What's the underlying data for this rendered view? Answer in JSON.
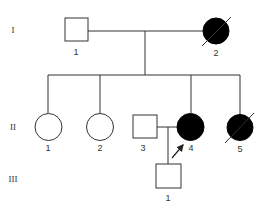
{
  "colors": {
    "line": "#333333",
    "affected": "#000000",
    "unaffected": "#ffffff"
  },
  "generations": [
    {
      "label": "I",
      "y": 30
    },
    {
      "label": "II",
      "y": 127
    },
    {
      "label": "III",
      "y": 179
    }
  ],
  "individuals": [
    {
      "id": "I-1",
      "generation": "I",
      "number": "1",
      "sex": "male",
      "affected": false,
      "deceased": false
    },
    {
      "id": "I-2",
      "generation": "I",
      "number": "2",
      "sex": "female",
      "affected": true,
      "deceased": true
    },
    {
      "id": "II-1",
      "generation": "II",
      "number": "1",
      "sex": "female",
      "affected": false,
      "deceased": false
    },
    {
      "id": "II-2",
      "generation": "II",
      "number": "2",
      "sex": "female",
      "affected": false,
      "deceased": false
    },
    {
      "id": "II-3",
      "generation": "II",
      "number": "3",
      "sex": "male",
      "affected": false,
      "deceased": false
    },
    {
      "id": "II-4",
      "generation": "II",
      "number": "4",
      "sex": "female",
      "affected": true,
      "deceased": false,
      "proband": true
    },
    {
      "id": "II-5",
      "generation": "II",
      "number": "5",
      "sex": "female",
      "affected": true,
      "deceased": true
    },
    {
      "id": "III-1",
      "generation": "III",
      "number": "1",
      "sex": "male",
      "affected": false,
      "deceased": false
    }
  ],
  "relationships": [
    {
      "type": "marriage",
      "partners": [
        "I-1",
        "I-2"
      ],
      "children": [
        "II-1",
        "II-2",
        "II-4",
        "II-5"
      ]
    },
    {
      "type": "marriage",
      "partners": [
        "II-3",
        "II-4"
      ],
      "children": [
        "III-1"
      ]
    }
  ],
  "proband_marker": {
    "target": "II-4",
    "symbol": "arrow"
  }
}
